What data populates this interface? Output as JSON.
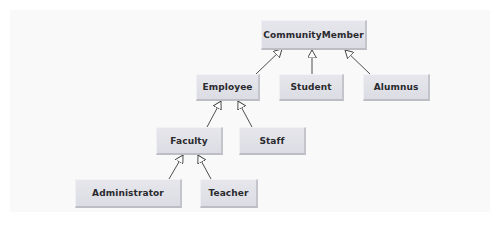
{
  "diagram": {
    "type": "UML class inheritance hierarchy",
    "nodes": {
      "community_member": "CommunityMember",
      "employee": "Employee",
      "student": "Student",
      "alumnus": "Alumnus",
      "faculty": "Faculty",
      "staff": "Staff",
      "administrator": "Administrator",
      "teacher": "Teacher"
    },
    "edges": [
      {
        "from": "Employee",
        "to": "CommunityMember",
        "kind": "generalization"
      },
      {
        "from": "Student",
        "to": "CommunityMember",
        "kind": "generalization"
      },
      {
        "from": "Alumnus",
        "to": "CommunityMember",
        "kind": "generalization"
      },
      {
        "from": "Faculty",
        "to": "Employee",
        "kind": "generalization"
      },
      {
        "from": "Staff",
        "to": "Employee",
        "kind": "generalization"
      },
      {
        "from": "Administrator",
        "to": "Faculty",
        "kind": "generalization"
      },
      {
        "from": "Teacher",
        "to": "Faculty",
        "kind": "generalization"
      }
    ],
    "colors": {
      "node_fill": "#e2e2e8",
      "node_text": "#2a2a2e",
      "edge": "#3a3a3a",
      "background": "#f9f9fa"
    }
  }
}
